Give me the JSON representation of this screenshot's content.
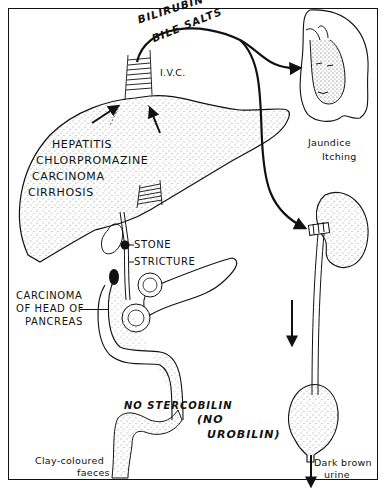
{
  "diagram": {
    "top_labels": {
      "bilirubin": "BILIRUBIN +++",
      "bile_salts": "BILE SALTS",
      "ivc": "I.V.C."
    },
    "liver_causes": [
      "HEPATITIS",
      "CHLORPROMAZINE",
      "CARCINOMA",
      "CIRRHOSIS"
    ],
    "duct_labels": {
      "stone": "STONE",
      "stricture": "STRICTURE"
    },
    "pancreas_label": [
      "CARCINOMA",
      "OF HEAD OF",
      "PANCREAS"
    ],
    "face_labels": [
      "Jaundice",
      "Itching"
    ],
    "gut_labels": {
      "no_stercobilin": "NO STERCOBILIN",
      "no_urobilin_1": "(NO",
      "no_urobilin_2": "UROBILIN)"
    },
    "faeces_label": [
      "Clay-coloured",
      "faeces"
    ],
    "urine_label": [
      "Dark brown",
      "urine"
    ],
    "colors": {
      "ink": "#111111",
      "background": "#ffffff"
    }
  }
}
